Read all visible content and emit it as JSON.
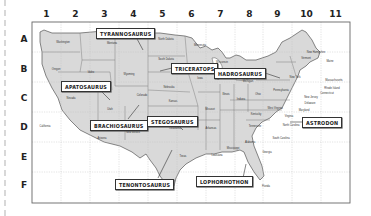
{
  "map": {
    "title": "Dinosaur fossil locations — US grid map",
    "columns": [
      "1",
      "2",
      "3",
      "4",
      "5",
      "6",
      "7",
      "8",
      "9",
      "10",
      "11"
    ],
    "rows": [
      "A",
      "B",
      "C",
      "D",
      "E",
      "F"
    ],
    "colors": {
      "land": "#d9d9d9",
      "border": "#555555",
      "grid": "#bbbbbb",
      "frame": "#666666"
    },
    "dinosaurs": [
      {
        "name": "TYRANNOSAURUS",
        "grid": "A3-A4"
      },
      {
        "name": "TRICERATOPS",
        "grid": "B5-B6"
      },
      {
        "name": "HADROSAURUS",
        "grid": "B8-B9"
      },
      {
        "name": "APATOSAURUS",
        "grid": "C2"
      },
      {
        "name": "BRACHIOSAURUS",
        "grid": "D3"
      },
      {
        "name": "STEGOSAURUS",
        "grid": "D5"
      },
      {
        "name": "ASTRODON",
        "grid": "D10"
      },
      {
        "name": "TENONTOSAURUS",
        "grid": "F5"
      },
      {
        "name": "LOPHORHOTHON",
        "grid": "F7"
      }
    ],
    "states": [
      "Washington",
      "Oregon",
      "Idaho",
      "Montana",
      "Wyoming",
      "Nevada",
      "California",
      "Utah",
      "Colorado",
      "Arizona",
      "New Mexico",
      "North Dakota",
      "South Dakota",
      "Nebraska",
      "Kansas",
      "Oklahoma",
      "Texas",
      "Minnesota",
      "Iowa",
      "Missouri",
      "Arkansas",
      "Louisiana",
      "Wisconsin",
      "Illinois",
      "Michigan",
      "Indiana",
      "Ohio",
      "Kentucky",
      "Tennessee",
      "Mississippi",
      "Alabama",
      "Georgia",
      "Florida",
      "South Carolina",
      "North Carolina",
      "Virginia",
      "West Virginia",
      "Maryland",
      "Delaware",
      "New Jersey",
      "Pennsylvania",
      "New York",
      "Vermont",
      "New Hampshire",
      "Maine",
      "Massachusetts",
      "Rhode Island",
      "Connecticut"
    ]
  }
}
